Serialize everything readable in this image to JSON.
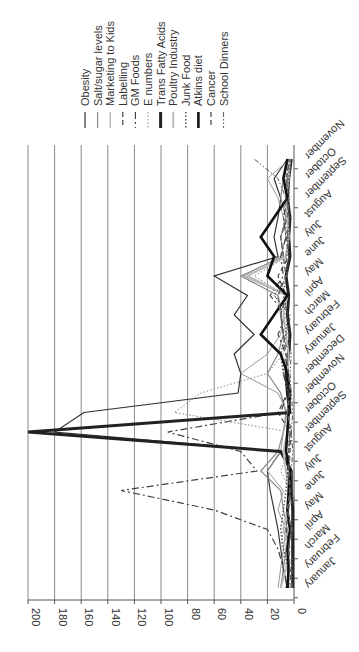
{
  "chart_data": {
    "type": "line",
    "orientation": "rotated-90-clockwise",
    "title": "",
    "xlabel": "",
    "ylabel": "",
    "ylim": [
      0,
      200
    ],
    "yticks": [
      0,
      20,
      40,
      60,
      80,
      100,
      120,
      140,
      160,
      180,
      200
    ],
    "grid": true,
    "legend_position": "right",
    "categories": [
      "January",
      "February",
      "March",
      "April",
      "May",
      "June",
      "July",
      "August",
      "September",
      "October",
      "November",
      "December",
      "January",
      "February",
      "March",
      "April",
      "May",
      "June",
      "July",
      "August",
      "September",
      "October",
      "November"
    ],
    "series": [
      {
        "name": "Obesity",
        "style": "solid",
        "color": "#333333",
        "width": 1.2,
        "values": [
          5,
          8,
          10,
          12,
          15,
          18,
          20,
          10,
          180,
          158,
          42,
          40,
          45,
          30,
          45,
          35,
          60,
          12,
          15,
          12,
          10,
          15,
          5
        ]
      },
      {
        "name": "Salt/sugar levels",
        "style": "solid",
        "color": "#888888",
        "width": 1.2,
        "values": [
          10,
          8,
          6,
          5,
          8,
          10,
          25,
          12,
          8,
          6,
          10,
          20,
          12,
          8,
          10,
          12,
          40,
          8,
          10,
          6,
          10,
          8,
          4
        ]
      },
      {
        "name": "Marketing to Kids",
        "style": "solid",
        "color": "#999999",
        "width": 1,
        "values": [
          12,
          10,
          8,
          6,
          12,
          8,
          20,
          10,
          8,
          5,
          12,
          40,
          20,
          10,
          8,
          6,
          38,
          10,
          6,
          8,
          12,
          20,
          3
        ]
      },
      {
        "name": "Labelling",
        "style": "dash",
        "color": "#444444",
        "width": 1.2,
        "values": [
          4,
          5,
          3,
          6,
          4,
          3,
          5,
          4,
          3,
          12,
          5,
          6,
          4,
          8,
          10,
          6,
          12,
          4,
          6,
          3,
          5,
          4,
          2
        ]
      },
      {
        "name": "GM Foods",
        "style": "dashdot",
        "color": "#444444",
        "width": 1.2,
        "values": [
          5,
          8,
          12,
          20,
          60,
          130,
          28,
          40,
          95,
          10,
          5,
          8,
          6,
          12,
          6,
          18,
          8,
          10,
          6,
          8,
          4,
          6,
          3
        ]
      },
      {
        "name": "E numbers",
        "style": "dot",
        "color": "#888888",
        "width": 1,
        "values": [
          3,
          5,
          10,
          8,
          4,
          3,
          10,
          4,
          3,
          90,
          70,
          20,
          8,
          5,
          4,
          6,
          30,
          5,
          4,
          6,
          3,
          5,
          2
        ]
      },
      {
        "name": "Trans Fatty Acids",
        "style": "solid",
        "color": "#222222",
        "width": 3,
        "values": [
          1,
          1,
          1,
          1,
          1,
          2,
          2,
          10,
          200,
          3,
          5,
          6,
          4,
          3,
          5,
          4,
          6,
          3,
          4,
          3,
          5,
          4,
          2
        ]
      },
      {
        "name": "Poultry Industry",
        "style": "solid",
        "color": "#bbbbbb",
        "width": 2,
        "values": [
          10,
          6,
          4,
          8,
          5,
          4,
          6,
          8,
          5,
          4,
          3,
          5,
          4,
          6,
          8,
          5,
          35,
          6,
          4,
          5,
          6,
          4,
          3
        ]
      },
      {
        "name": "Junk Food",
        "style": "dot",
        "color": "#555555",
        "width": 1.5,
        "values": [
          6,
          4,
          8,
          10,
          8,
          6,
          5,
          4,
          3,
          5,
          4,
          8,
          10,
          6,
          5,
          8,
          6,
          4,
          5,
          3,
          6,
          4,
          2
        ]
      },
      {
        "name": "Atkins diet",
        "style": "solid",
        "color": "#111111",
        "width": 2.6,
        "values": [
          5,
          4,
          5,
          3,
          5,
          4,
          3,
          6,
          5,
          4,
          3,
          5,
          10,
          25,
          15,
          5,
          20,
          15,
          25,
          15,
          5,
          8,
          5
        ]
      },
      {
        "name": "Cancer",
        "style": "dash",
        "color": "#666666",
        "width": 1.5,
        "values": [
          2,
          3,
          4,
          2,
          5,
          3,
          4,
          3,
          2,
          5,
          3,
          4,
          6,
          8,
          10,
          12,
          6,
          8,
          10,
          5,
          4,
          6,
          3
        ]
      },
      {
        "name": "School Dinners",
        "style": "dashdotdot",
        "color": "#555555",
        "width": 1,
        "values": [
          1,
          1,
          2,
          1,
          2,
          1,
          2,
          1,
          2,
          1,
          2,
          3,
          2,
          4,
          3,
          15,
          5,
          6,
          4,
          8,
          6,
          12,
          30
        ]
      }
    ]
  },
  "legend": {
    "items": [
      "Obesity",
      "Salt/sugar levels",
      "Marketing to Kids",
      "Labelling",
      "GM Foods",
      "E numbers",
      "Trans Fatty Acids",
      "Poultry Industry",
      "Junk Food",
      "Atkins diet",
      "Cancer",
      "School Dinners"
    ]
  }
}
